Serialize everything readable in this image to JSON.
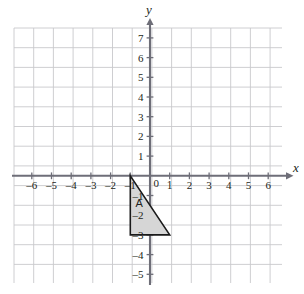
{
  "figure": {
    "kind": "cartesian-coordinate-grid",
    "background_color": "#ffffff",
    "grid_color": "#c8c8cc",
    "axis_color": "#6e6e78",
    "label_color": "#231f20",
    "shape_fill_color": "#d6d6d6",
    "shape_stroke_color": "#1a1a1a",
    "clipped_caption": "",
    "x_axis_label": "x",
    "y_axis_label": "y",
    "origin_label": "0"
  },
  "chart_data": {
    "type": "scatter",
    "title": "",
    "subtitle": "",
    "xlabel": "x",
    "ylabel": "y",
    "grid": true,
    "legend": "none",
    "xlim": [
      -7,
      7
    ],
    "ylim": [
      -6,
      8
    ],
    "x_ticks": [
      -6,
      -5,
      -4,
      -3,
      -2,
      -1,
      1,
      2,
      3,
      4,
      5,
      6
    ],
    "y_ticks": [
      7,
      6,
      5,
      4,
      3,
      2,
      1,
      -1,
      -2,
      -3,
      -4,
      -5
    ],
    "x_tick_labels": [
      "-6",
      "-5",
      "-4",
      "-3",
      "-2",
      "-1",
      "1",
      "2",
      "3",
      "4",
      "5",
      "6"
    ],
    "y_tick_labels": [
      "7",
      "6",
      "5",
      "4",
      "3",
      "2",
      "1",
      "-1",
      "-2",
      "-3",
      "-4",
      "-5"
    ],
    "annotations": [
      {
        "label": "A",
        "shape": "triangle",
        "vertices": [
          [
            -1,
            0
          ],
          [
            -1,
            -3
          ],
          [
            1,
            -3
          ]
        ],
        "label_position": [
          -0.55,
          -1.6
        ],
        "fill": "#d6d6d6",
        "stroke": "#1a1a1a"
      }
    ],
    "series": [
      {
        "name": "Triangle A",
        "x": [
          -1,
          -1,
          1
        ],
        "y": [
          0,
          -3,
          -3
        ]
      }
    ]
  },
  "x_ticks": [
    {
      "value": -6,
      "label": "-6"
    },
    {
      "value": -5,
      "label": "-5"
    },
    {
      "value": -4,
      "label": "-4"
    },
    {
      "value": -3,
      "label": "-3"
    },
    {
      "value": -2,
      "label": "-2"
    },
    {
      "value": -1,
      "label": "-1"
    },
    {
      "value": 1,
      "label": "1"
    },
    {
      "value": 2,
      "label": "2"
    },
    {
      "value": 3,
      "label": "3"
    },
    {
      "value": 4,
      "label": "4"
    },
    {
      "value": 5,
      "label": "5"
    },
    {
      "value": 6,
      "label": "6"
    }
  ],
  "y_ticks": [
    {
      "value": 7,
      "label": "7"
    },
    {
      "value": 6,
      "label": "6"
    },
    {
      "value": 5,
      "label": "5"
    },
    {
      "value": 4,
      "label": "4"
    },
    {
      "value": 3,
      "label": "3"
    },
    {
      "value": 2,
      "label": "2"
    },
    {
      "value": 1,
      "label": "1"
    },
    {
      "value": -1,
      "label": "-1"
    },
    {
      "value": -2,
      "label": "-2"
    },
    {
      "value": -3,
      "label": "-3"
    },
    {
      "value": -4,
      "label": "-4"
    },
    {
      "value": -5,
      "label": "-5"
    }
  ]
}
